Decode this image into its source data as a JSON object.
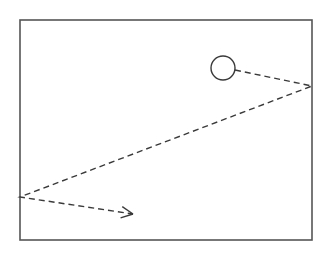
{
  "diagram": {
    "colors": {
      "background": "#ffffff",
      "stroke": "#3a3a3a",
      "box": "#555555"
    },
    "box": {
      "x": 20,
      "y": 20,
      "width": 292,
      "height": 220
    },
    "ball": {
      "cx": 223,
      "cy": 68,
      "r": 12
    },
    "path": {
      "style": "dashed",
      "points": [
        [
          235,
          70
        ],
        [
          312,
          86
        ],
        [
          20,
          197
        ],
        [
          133,
          214
        ]
      ]
    },
    "arrowhead": {
      "tip": [
        133,
        214
      ],
      "from": [
        20,
        197
      ]
    }
  }
}
